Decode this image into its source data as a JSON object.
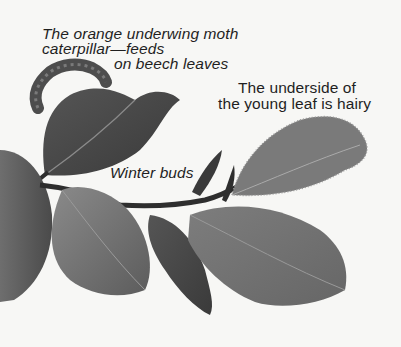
{
  "illustration": {
    "subject": "Beech twig with leaves, winter buds and caterpillar",
    "palette": {
      "background": "#f7f7f5",
      "leaf_dark": "#3e3e3e",
      "leaf_mid": "#6a6a6a",
      "leaf_light": "#8c8c8c",
      "leaf_hairy": "#7a7a7a",
      "stem": "#2e2e2e",
      "caterpillar": "#5a5a5a",
      "text": "#1f1f1f"
    }
  },
  "labels": {
    "caterpillar": {
      "line1": "The orange underwing moth",
      "line2": "caterpillar—feeds",
      "line3": "on beech leaves"
    },
    "hairy_leaf": {
      "line1": "The underside of",
      "line2": "the young leaf is hairy"
    },
    "winter_buds": "Winter buds"
  }
}
